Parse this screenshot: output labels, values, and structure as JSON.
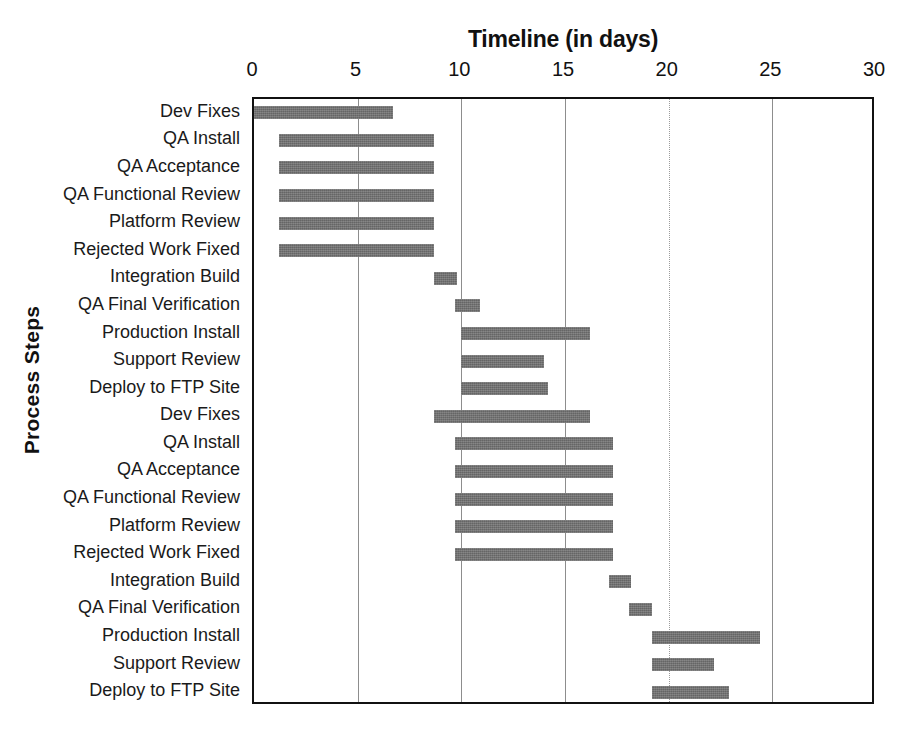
{
  "chart_data": {
    "type": "bar",
    "subtype": "gantt",
    "title": "Timeline (in days)",
    "xlabel": "Timeline (in days)",
    "ylabel": "Process Steps",
    "xlim": [
      0,
      30
    ],
    "xticks": [
      0,
      5,
      10,
      15,
      20,
      25,
      30
    ],
    "xtick_labels": [
      "0",
      "5",
      "10",
      "15",
      "20",
      "25",
      "30"
    ],
    "grid": true,
    "gridlines_at": [
      5,
      10,
      15,
      20,
      25
    ],
    "legend": null,
    "bar_color": "#6e6e6e",
    "axis_color": "#111111",
    "grid_color": "#8d8d8d",
    "categories": [
      "Dev Fixes",
      "QA Install",
      "QA Acceptance",
      "QA Functional Review",
      "Platform Review",
      "Rejected Work Fixed",
      "Integration Build",
      "QA Final Verification",
      "Production Install",
      "Support Review",
      "Deploy to FTP Site",
      "Dev Fixes",
      "QA Install",
      "QA Acceptance",
      "QA Functional Review",
      "Platform Review",
      "Rejected Work Fixed",
      "Integration Build",
      "QA Final Verification",
      "Production Install",
      "Support Review",
      "Deploy to FTP Site"
    ],
    "tasks": [
      {
        "label": "Dev Fixes",
        "start": 0.0,
        "end": 6.7
      },
      {
        "label": "QA Install",
        "start": 1.2,
        "end": 8.7
      },
      {
        "label": "QA Acceptance",
        "start": 1.2,
        "end": 8.7
      },
      {
        "label": "QA Functional Review",
        "start": 1.2,
        "end": 8.7
      },
      {
        "label": "Platform Review",
        "start": 1.2,
        "end": 8.7
      },
      {
        "label": "Rejected Work Fixed",
        "start": 1.2,
        "end": 8.7
      },
      {
        "label": "Integration Build",
        "start": 8.7,
        "end": 9.8
      },
      {
        "label": "QA Final Verification",
        "start": 9.7,
        "end": 10.9
      },
      {
        "label": "Production Install",
        "start": 10.0,
        "end": 16.2
      },
      {
        "label": "Support Review",
        "start": 10.0,
        "end": 14.0
      },
      {
        "label": "Deploy to FTP Site",
        "start": 10.0,
        "end": 14.2
      },
      {
        "label": "Dev Fixes",
        "start": 8.7,
        "end": 16.2
      },
      {
        "label": "QA Install",
        "start": 9.7,
        "end": 17.3
      },
      {
        "label": "QA Acceptance",
        "start": 9.7,
        "end": 17.3
      },
      {
        "label": "QA Functional Review",
        "start": 9.7,
        "end": 17.3
      },
      {
        "label": "Platform Review",
        "start": 9.7,
        "end": 17.3
      },
      {
        "label": "Rejected Work Fixed",
        "start": 9.7,
        "end": 17.3
      },
      {
        "label": "Integration Build",
        "start": 17.1,
        "end": 18.2
      },
      {
        "label": "QA Final Verification",
        "start": 18.1,
        "end": 19.2
      },
      {
        "label": "Production Install",
        "start": 19.2,
        "end": 24.4
      },
      {
        "label": "Support Review",
        "start": 19.2,
        "end": 22.2
      },
      {
        "label": "Deploy to FTP Site",
        "start": 19.2,
        "end": 22.9
      }
    ]
  }
}
